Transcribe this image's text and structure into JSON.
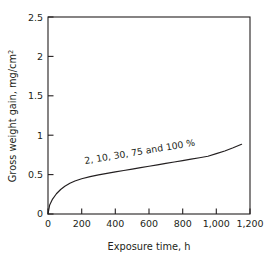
{
  "chart_data": {
    "type": "line",
    "title": "",
    "xlabel": "Exposure time, h",
    "ylabel": "Gross weight gain, mg/cm2",
    "ylabel_base": "Gross weight gain, mg/cm",
    "ylabel_exponent": "2",
    "xlim": [
      0,
      1200
    ],
    "ylim": [
      0,
      2.5
    ],
    "grid": false,
    "legend": "none",
    "xticks": [
      0,
      200,
      400,
      600,
      800,
      1000,
      1200
    ],
    "xtick_labels": [
      "0",
      "200",
      "400",
      "600",
      "800",
      "1,000",
      "1,200"
    ],
    "yticks": [
      0,
      0.5,
      1,
      1.5,
      2,
      2.5
    ],
    "ytick_labels": [
      "0",
      "0.5",
      "1",
      "1.5",
      "2",
      "2.5"
    ],
    "annotations": [
      {
        "text": "2, 10, 30, 75 and 100 %",
        "x": 250,
        "y": 0.66,
        "rotation": -9.5
      }
    ],
    "series": [
      {
        "name": "2, 10, 30, 75 and 100 %",
        "color": "#231f20",
        "x": [
          0,
          10,
          25,
          50,
          75,
          100,
          130,
          160,
          200,
          250,
          300,
          350,
          400,
          450,
          500,
          550,
          600,
          650,
          700,
          750,
          800,
          850,
          900,
          950,
          1000,
          1050,
          1100,
          1150
        ],
        "values": [
          0,
          0.115,
          0.182,
          0.257,
          0.311,
          0.352,
          0.39,
          0.418,
          0.447,
          0.474,
          0.496,
          0.515,
          0.534,
          0.552,
          0.57,
          0.588,
          0.606,
          0.624,
          0.642,
          0.66,
          0.678,
          0.696,
          0.714,
          0.733,
          0.766,
          0.8,
          0.84,
          0.885
        ]
      }
    ]
  },
  "axes": {
    "x_title": "Exposure time, h",
    "y_title_base": "Gross weight gain, mg/cm",
    "y_title_exponent": "2"
  },
  "ticks": {
    "x": [
      "0",
      "200",
      "400",
      "600",
      "800",
      "1,000",
      "1,200"
    ],
    "y": [
      "0",
      "0.5",
      "1",
      "1.5",
      "2",
      "2.5"
    ]
  },
  "curve_label": "2, 10, 30, 75 and 100 %"
}
